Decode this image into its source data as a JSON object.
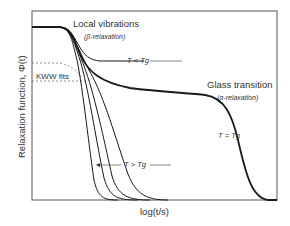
{
  "figure": {
    "ylabel": "Relaxation function, Φ(t)",
    "xlabel": "log(t/s)",
    "annotations": {
      "local_vibrations": "Local vibrations",
      "beta_relaxation": "(β-relaxation)",
      "t_less_tg": "T < Tg",
      "kww_fits": "KWW fits",
      "glass_transition": "Glass transition",
      "alpha_relaxation": "(α-relaxation)",
      "t_equals_tg": "T = Tg",
      "t_greater_tg": "T > Tg"
    },
    "colors": {
      "curve": "#1a1a1a",
      "frame": "#555555",
      "text": "#333333",
      "dashed": "#777777"
    }
  }
}
